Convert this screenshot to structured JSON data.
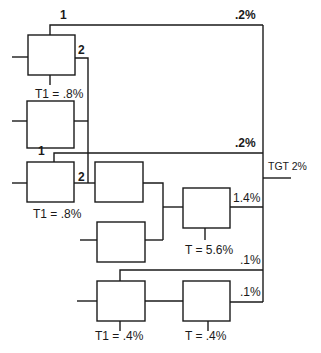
{
  "diagram": {
    "type": "tolerance / error budget block diagram",
    "line_color": "#1a1a1a",
    "background": "#ffffff",
    "target": {
      "label": "TGT 2%"
    },
    "branch_labels": {
      "top_path_input": "1",
      "top_path_pct": ".2%",
      "box_a_output": "2",
      "second_path_input": "1",
      "second_path_pct": ".2%",
      "box_c_output": "2",
      "box_f_output_pct": "1.4%",
      "lower_path_pct": ".1%",
      "box_h_output_pct": ".1%"
    },
    "tolerances": {
      "box_a": "T1 = .8%",
      "box_c": "T1 = .8%",
      "box_f": "T = 5.6%",
      "box_g": "T1 = .4%",
      "box_h": "T = .4%"
    },
    "blocks": [
      {
        "id": "box-a",
        "tolerance": "T1 = .8%"
      },
      {
        "id": "box-b",
        "tolerance": ""
      },
      {
        "id": "box-c",
        "tolerance": "T1 = .8%"
      },
      {
        "id": "box-d",
        "tolerance": ""
      },
      {
        "id": "box-e",
        "tolerance": ""
      },
      {
        "id": "box-f",
        "tolerance": "T = 5.6%"
      },
      {
        "id": "box-g",
        "tolerance": "T1 = .4%"
      },
      {
        "id": "box-h",
        "tolerance": "T = .4%"
      }
    ]
  }
}
